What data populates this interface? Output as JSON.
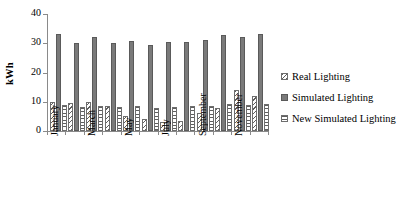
{
  "chart_data": {
    "type": "bar",
    "title": "",
    "xlabel": "",
    "ylabel": "kWh",
    "ylim": [
      0,
      40
    ],
    "yticks": [
      0,
      10,
      20,
      30,
      40
    ],
    "grid": false,
    "legend_position": "right",
    "categories": [
      "January",
      "February",
      "March",
      "April",
      "May",
      "June",
      "July",
      "August",
      "September",
      "October",
      "November",
      "December"
    ],
    "visible_tick_labels": [
      "January",
      "March",
      "May",
      "July",
      "September",
      "November"
    ],
    "series": [
      {
        "name": "Real Lighting",
        "pattern": "diagonal-hatch",
        "color": "#5f5f5f",
        "values": [
          10.0,
          9.5,
          10.0,
          8.5,
          5.0,
          4.0,
          3.0,
          3.3,
          6.0,
          8.0,
          14.0,
          12.0
        ]
      },
      {
        "name": "Simulated Lighting",
        "pattern": "solid",
        "color": "#7a7a7a",
        "values": [
          33.0,
          30.0,
          32.3,
          30.2,
          30.7,
          29.3,
          30.3,
          30.6,
          31.0,
          32.8,
          32.0,
          33.3
        ]
      },
      {
        "name": "New Simulated Lighting",
        "pattern": "horizontal-stripe",
        "color": "#5f5f5f",
        "values": [
          8.8,
          8.2,
          8.6,
          8.3,
          8.4,
          7.8,
          8.2,
          8.4,
          8.4,
          9.1,
          8.8,
          9.1
        ]
      }
    ]
  }
}
